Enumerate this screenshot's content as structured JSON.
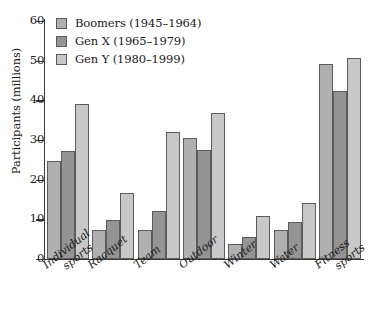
{
  "chart_data": {
    "type": "bar",
    "title": "",
    "xlabel": "",
    "ylabel": "Participants (millions)",
    "ylim": [
      0,
      60
    ],
    "yticks": [
      0,
      10,
      20,
      30,
      40,
      50,
      60
    ],
    "grid": false,
    "legend_position": "top-left",
    "categories": [
      "Individual sports",
      "Racquet",
      "Team",
      "Outdoor",
      "Winter",
      "Water",
      "Fitness sports"
    ],
    "category_lines": [
      [
        "Individual",
        "sports"
      ],
      [
        "Racquet",
        ""
      ],
      [
        "Team",
        ""
      ],
      [
        "Outdoor",
        ""
      ],
      [
        "Winter",
        ""
      ],
      [
        "Water",
        ""
      ],
      [
        "Fitness",
        "sports"
      ]
    ],
    "series": [
      {
        "name": "Boomers (1945–1964)",
        "color": "#b0b0b0",
        "values": [
          24.8,
          7.4,
          7.2,
          30.4,
          3.8,
          7.4,
          49.2
        ]
      },
      {
        "name": "Gen X (1965–1979)",
        "color": "#949494",
        "values": [
          27.2,
          9.8,
          12.2,
          27.4,
          5.6,
          9.3,
          42.3
        ]
      },
      {
        "name": "Gen Y (1980–1999)",
        "color": "#c8c8c8",
        "values": [
          39.0,
          16.6,
          32.1,
          36.7,
          10.8,
          14.2,
          50.7
        ]
      }
    ]
  }
}
